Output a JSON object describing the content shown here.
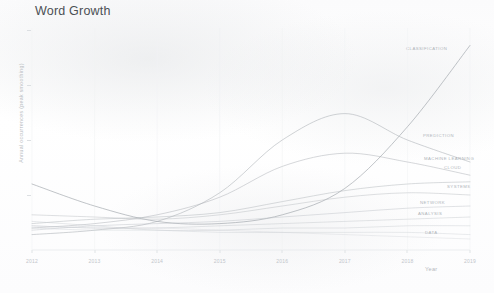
{
  "chart": {
    "title": "Word Growth",
    "xlabel": "Year",
    "ylabel": "Annual occurrences (peak smoothing)"
  },
  "chart_data": {
    "type": "line",
    "title": "Word Growth",
    "xlabel": "Year",
    "ylabel": "Annual occurrences (peak smoothing)",
    "x": [
      2012,
      2013,
      2014,
      2015,
      2016,
      2017,
      2018,
      2019
    ],
    "xlim": [
      2012,
      2019
    ],
    "ylim": [
      0,
      1
    ],
    "grid": false,
    "legend": "end-of-line labels",
    "series": [
      {
        "name": "CLASSIFICATION",
        "color": "#9aa0a6",
        "values": [
          0.3,
          0.2,
          0.13,
          0.12,
          0.16,
          0.28,
          0.56,
          0.93
        ]
      },
      {
        "name": "PREDICTION",
        "color": "#a3a8ad",
        "values": [
          0.07,
          0.09,
          0.13,
          0.26,
          0.5,
          0.62,
          0.5,
          0.4
        ]
      },
      {
        "name": "MACHINE LEARNING",
        "color": "#a8adb2",
        "values": [
          0.1,
          0.12,
          0.16,
          0.24,
          0.38,
          0.44,
          0.4,
          0.34
        ]
      },
      {
        "name": "CLOUD",
        "color": "#aeb3b8",
        "values": [
          0.12,
          0.14,
          0.15,
          0.17,
          0.22,
          0.27,
          0.3,
          0.31
        ]
      },
      {
        "name": "SYSTEMS",
        "color": "#b2b7bc",
        "values": [
          0.16,
          0.15,
          0.14,
          0.16,
          0.2,
          0.24,
          0.26,
          0.25
        ]
      },
      {
        "name": "NETWORK",
        "color": "#b6bbc0",
        "values": [
          0.09,
          0.11,
          0.12,
          0.13,
          0.15,
          0.17,
          0.19,
          0.2
        ]
      },
      {
        "name": "ANALYSIS",
        "color": "#babfc4",
        "values": [
          0.11,
          0.1,
          0.1,
          0.11,
          0.12,
          0.13,
          0.14,
          0.15
        ]
      },
      {
        "name": "DATA",
        "color": "#bec3c8",
        "values": [
          0.13,
          0.11,
          0.09,
          0.09,
          0.1,
          0.1,
          0.11,
          0.11
        ]
      },
      {
        "name": "MODEL",
        "color": "#c2c7cc",
        "values": [
          0.1,
          0.09,
          0.09,
          0.08,
          0.08,
          0.08,
          0.08,
          0.07
        ]
      },
      {
        "name": "SECURITY",
        "color": "#c6cbd0",
        "values": [
          0.11,
          0.1,
          0.1,
          0.09,
          0.08,
          0.07,
          0.06,
          0.05
        ]
      }
    ]
  },
  "axis": {
    "xticks": [
      "2012",
      "2013",
      "2014",
      "2015",
      "2016",
      "2017",
      "2018",
      "2019"
    ],
    "ytick_count": 4
  },
  "labels": [
    {
      "text": "CLASSIFICATION",
      "x": 406,
      "y": 48
    },
    {
      "text": "PREDICTION",
      "x": 423,
      "y": 135
    },
    {
      "text": "MACHINE LEARNING",
      "x": 424,
      "y": 158
    },
    {
      "text": "CLOUD",
      "x": 444,
      "y": 167
    },
    {
      "text": "SYSTEMS",
      "x": 447,
      "y": 186
    },
    {
      "text": "NETWORK",
      "x": 420,
      "y": 202
    },
    {
      "text": "ANALYSIS",
      "x": 418,
      "y": 213
    },
    {
      "text": "DATA",
      "x": 425,
      "y": 232
    }
  ]
}
